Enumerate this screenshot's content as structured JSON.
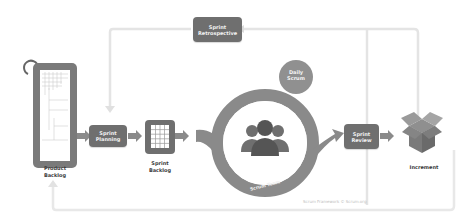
{
  "diagram": {
    "title": "Scrum Framework",
    "nodes": {
      "product_backlog": {
        "label_line1": "Product",
        "label_line2": "Backlog"
      },
      "sprint_planning": {
        "label_line1": "Sprint",
        "label_line2": "Planning"
      },
      "sprint_backlog": {
        "label_line1": "Sprint",
        "label_line2": "Backlog"
      },
      "daily_scrum": {
        "label_line1": "Daily",
        "label_line2": "Scrum"
      },
      "scrum_team": {
        "label": "Scrum Team"
      },
      "sprint_review": {
        "label_line1": "Sprint",
        "label_line2": "Review"
      },
      "increment": {
        "label": "Increment"
      },
      "sprint_retrospective": {
        "label_line1": "Sprint",
        "label_line2": "Retrospective"
      }
    },
    "credit": "Scrum Framework © Scrum.org"
  },
  "colors": {
    "box": "#6f6f6f",
    "ring": "#8a8a8a",
    "loop_line": "#e6e6e6",
    "text": "#3a3a3a"
  }
}
